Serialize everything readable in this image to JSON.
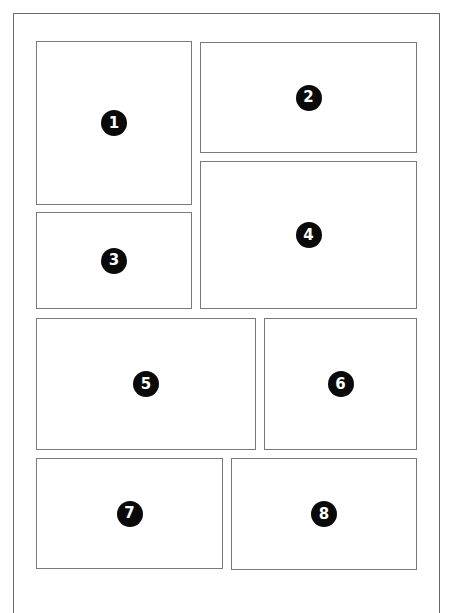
{
  "layout_diagram": {
    "description": "Comic page panel layout with eight numbered panels",
    "panels": [
      {
        "number": "1",
        "x": 36,
        "y": 41,
        "w": 156,
        "h": 164
      },
      {
        "number": "2",
        "x": 200,
        "y": 42,
        "w": 217,
        "h": 111
      },
      {
        "number": "3",
        "x": 36,
        "y": 212,
        "w": 156,
        "h": 97
      },
      {
        "number": "4",
        "x": 200,
        "y": 161,
        "w": 217,
        "h": 148
      },
      {
        "number": "5",
        "x": 36,
        "y": 318,
        "w": 220,
        "h": 132
      },
      {
        "number": "6",
        "x": 264,
        "y": 318,
        "w": 153,
        "h": 132
      },
      {
        "number": "7",
        "x": 36,
        "y": 458,
        "w": 187,
        "h": 111
      },
      {
        "number": "8",
        "x": 231,
        "y": 458,
        "w": 186,
        "h": 112
      }
    ],
    "colors": {
      "border": "#7a7a7a",
      "badge": "#0a0a0a",
      "badge_text": "#ffffff",
      "background": "#ffffff"
    }
  }
}
